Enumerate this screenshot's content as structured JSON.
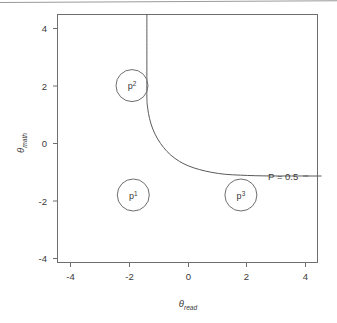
{
  "figure": {
    "kind": "contour-plot",
    "background_color": "#ffffff",
    "line_color": "#5a5a5a",
    "frame_color": "#6e6e6e",
    "text_color": "#3a3a3a",
    "page_rule_visible": true
  },
  "chart_data": {
    "type": "line",
    "title": "",
    "xlabel": "θread",
    "xlabel_base": "θ",
    "xlabel_sub": "read",
    "ylabel": "θmath",
    "ylabel_base": "θ",
    "ylabel_sub": "math",
    "xlim": [
      -4.8,
      4.8
    ],
    "ylim": [
      -4.5,
      4.5
    ],
    "xticks": [
      -4,
      -2,
      0,
      2,
      4
    ],
    "xtick_labels": [
      "-4",
      "-2",
      "0",
      "2",
      "4"
    ],
    "yticks": [
      -4,
      -2,
      0,
      2,
      4
    ],
    "ytick_labels": [
      "-4",
      "-2",
      "0",
      "2",
      "4"
    ],
    "grid": false,
    "legend": "none",
    "series": [
      {
        "name": "P = 0.5",
        "description": "decision boundary contour, hyperbola-like with vertical asymptote at theta_read = -1.5 and horizontal asymptote at theta_math = -1.35",
        "vertical_asymptote_x": -1.5,
        "horizontal_asymptote_y": -1.35,
        "points": [
          [
            -1.5,
            4.5
          ],
          [
            -1.5,
            2.6
          ],
          [
            -1.5,
            1.5
          ],
          [
            -1.47,
            1.1
          ],
          [
            -1.4,
            0.72
          ],
          [
            -1.28,
            0.34
          ],
          [
            -1.1,
            -0.02
          ],
          [
            -0.88,
            -0.33
          ],
          [
            -0.62,
            -0.6
          ],
          [
            -0.3,
            -0.83
          ],
          [
            0.05,
            -1.0
          ],
          [
            0.45,
            -1.13
          ],
          [
            0.9,
            -1.23
          ],
          [
            1.4,
            -1.3
          ],
          [
            1.95,
            -1.33
          ],
          [
            2.5,
            -1.35
          ],
          [
            3.1,
            -1.36
          ],
          [
            3.75,
            -1.36
          ],
          [
            4.45,
            -1.36
          ]
        ]
      }
    ],
    "annotations": [
      {
        "id": "contour-label",
        "text": "P = 0.5",
        "x": 3.05,
        "y": -1.36,
        "has_leader_line": true
      }
    ],
    "markers": [
      {
        "id": "p1",
        "label_base": "p",
        "label_sup": "1",
        "x": -2.0,
        "y": -2.05,
        "radius_px": 16,
        "shape": "circle-outline"
      },
      {
        "id": "p2",
        "label_base": "p",
        "label_sup": "2",
        "x": -2.05,
        "y": 1.92,
        "radius_px": 16,
        "shape": "circle-outline"
      },
      {
        "id": "p3",
        "label_base": "p",
        "label_sup": "3",
        "x": 1.97,
        "y": -2.05,
        "radius_px": 16,
        "shape": "circle-outline"
      }
    ]
  }
}
